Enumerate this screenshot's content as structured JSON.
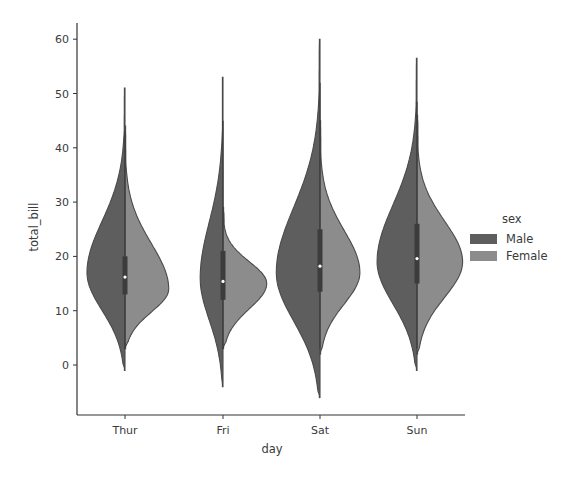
{
  "chart_data": {
    "type": "violin",
    "title": "",
    "xlabel": "day",
    "ylabel": "total_bill",
    "categories": [
      "Thur",
      "Fri",
      "Sat",
      "Sun"
    ],
    "yticks": [
      0,
      10,
      20,
      30,
      40,
      50,
      60
    ],
    "ylim": [
      -9,
      63
    ],
    "grid": false,
    "split": true,
    "legend": {
      "title": "sex",
      "position": "right",
      "entries": [
        "Male",
        "Female"
      ]
    },
    "series": [
      {
        "name": "Male",
        "color": "#5e5e5e",
        "side": "left",
        "violins": [
          {
            "category": "Thur",
            "min": -1,
            "max": 51,
            "median": 16.2,
            "q1": 13,
            "q3": 20,
            "mode": 17,
            "width": 1.0
          },
          {
            "category": "Fri",
            "min": -4,
            "max": 53,
            "median": 15.4,
            "q1": 12,
            "q3": 21,
            "mode": 16,
            "width": 0.6
          },
          {
            "category": "Sat",
            "min": -6,
            "max": 60,
            "median": 18.2,
            "q1": 13.5,
            "q3": 25,
            "mode": 17,
            "width": 1.15
          },
          {
            "category": "Sun",
            "min": -1,
            "max": 56.5,
            "median": 19.6,
            "q1": 15,
            "q3": 26,
            "mode": 19,
            "width": 1.05
          }
        ]
      },
      {
        "name": "Female",
        "color": "#8c8c8c",
        "side": "right",
        "violins": [
          {
            "category": "Thur",
            "min": 3,
            "max": 44,
            "median": 14,
            "mode": 14,
            "width": 1.15
          },
          {
            "category": "Fri",
            "min": 3,
            "max": 29,
            "median": 14,
            "mode": 15,
            "width": 1.15
          },
          {
            "category": "Sat",
            "min": 2,
            "max": 45,
            "median": 18,
            "mode": 17,
            "width": 1.05
          },
          {
            "category": "Sun",
            "min": 2,
            "max": 46,
            "median": 18,
            "mode": 19,
            "width": 1.2
          }
        ]
      }
    ]
  },
  "legend": {
    "title": "sex",
    "items": [
      {
        "label": "Male",
        "color": "#5e5e5e"
      },
      {
        "label": "Female",
        "color": "#8c8c8c"
      }
    ]
  },
  "axes": {
    "xlabel": "day",
    "ylabel": "total_bill"
  }
}
